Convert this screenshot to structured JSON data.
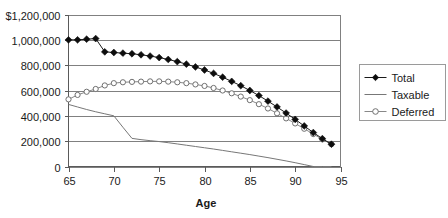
{
  "chart_data": {
    "type": "line",
    "title": "",
    "xlabel": "Age",
    "ylabel": "",
    "xlim": [
      65,
      95
    ],
    "ylim": [
      0,
      1200000
    ],
    "grid": true,
    "legend_position": "right",
    "x": [
      65,
      66,
      67,
      68,
      69,
      70,
      71,
      72,
      73,
      74,
      75,
      76,
      77,
      78,
      79,
      80,
      81,
      82,
      83,
      84,
      85,
      86,
      87,
      88,
      89,
      90,
      91,
      92,
      93,
      94
    ],
    "xticks": [
      65,
      70,
      75,
      80,
      85,
      90,
      95
    ],
    "xtick_labels": [
      "65",
      "70",
      "75",
      "80",
      "85",
      "90",
      "95"
    ],
    "yticks": [
      0,
      200000,
      400000,
      600000,
      800000,
      1000000,
      1200000
    ],
    "ytick_labels": [
      "0",
      "200,000",
      "400,000",
      "600,000",
      "800,000",
      "1,000,000",
      "$1,200,000"
    ],
    "series": [
      {
        "name": "Total",
        "marker": "filled-diamond",
        "color": "#0d0d0d",
        "values": [
          1000000,
          1000000,
          1005000,
          1010000,
          905000,
          900000,
          895000,
          890000,
          882000,
          872000,
          860000,
          845000,
          828000,
          808000,
          786000,
          762000,
          735000,
          705000,
          672000,
          638000,
          600000,
          560000,
          516000,
          470000,
          422000,
          372000,
          320000,
          268000,
          220000,
          176000
        ]
      },
      {
        "name": "Taxable",
        "marker": "none",
        "color": "#777777",
        "values": [
          490000,
          470000,
          450000,
          432000,
          416000,
          400000,
          310000,
          222000,
          212000,
          204000,
          197000,
          188000,
          178000,
          168000,
          158000,
          148000,
          138000,
          127000,
          116000,
          105000,
          94000,
          82000,
          70000,
          57000,
          44000,
          30000,
          15000,
          0,
          0,
          0
        ]
      },
      {
        "name": "Deferred",
        "marker": "open-circle",
        "color": "#888888",
        "values": [
          530000,
          565000,
          590000,
          612000,
          640000,
          658000,
          665000,
          668000,
          670000,
          672000,
          672000,
          670000,
          665000,
          658000,
          648000,
          636000,
          620000,
          600000,
          578000,
          552000,
          524000,
          492000,
          458000,
          420000,
          380000,
          340000,
          298000,
          256000,
          214000,
          176000
        ]
      }
    ]
  },
  "legend": {
    "items": [
      {
        "label": "Total",
        "marker": "filled-diamond"
      },
      {
        "label": "Taxable",
        "marker": "none"
      },
      {
        "label": "Deferred",
        "marker": "open-circle"
      }
    ]
  },
  "axis": {
    "x_title": "Age"
  }
}
